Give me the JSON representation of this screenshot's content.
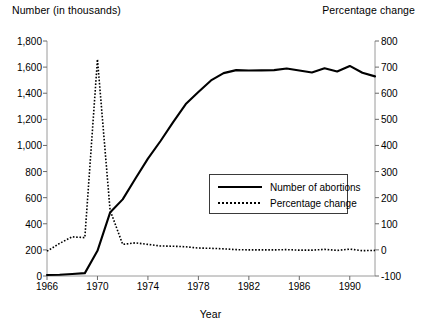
{
  "chart_data": {
    "type": "line",
    "title": "",
    "xlabel": "Year",
    "ylabel": "Number (in thousands)",
    "y2label": "Percentage change",
    "xlim": [
      1966,
      1992
    ],
    "ylim": [
      0,
      1800
    ],
    "y2lim": [
      -100,
      800
    ],
    "grid": false,
    "legend_position": "center-right",
    "x_ticks": [
      "1966",
      "1970",
      "1974",
      "1978",
      "1982",
      "1986",
      "1990"
    ],
    "x_tick_values": [
      1966,
      1970,
      1974,
      1978,
      1982,
      1986,
      1990
    ],
    "y_ticks": [
      "0",
      "200",
      "400",
      "600",
      "800",
      "1,000",
      "1,200",
      "1,400",
      "1,600",
      "1,800"
    ],
    "y_tick_values": [
      0,
      200,
      400,
      600,
      800,
      1000,
      1200,
      1400,
      1600,
      1800
    ],
    "y2_ticks": [
      "-100",
      "0",
      "100",
      "200",
      "300",
      "400",
      "500",
      "600",
      "700",
      "800"
    ],
    "y2_tick_values": [
      -100,
      0,
      100,
      200,
      300,
      400,
      500,
      600,
      700,
      800
    ],
    "x": [
      1966,
      1967,
      1968,
      1969,
      1970,
      1971,
      1972,
      1973,
      1974,
      1975,
      1976,
      1977,
      1978,
      1979,
      1980,
      1981,
      1982,
      1983,
      1984,
      1985,
      1986,
      1987,
      1988,
      1989,
      1990,
      1991,
      1992
    ],
    "series": [
      {
        "name": "Number of abortions",
        "axis": "left",
        "style": "solid",
        "color": "#000000",
        "values": [
          8,
          10,
          15,
          22,
          193,
          486,
          587,
          745,
          899,
          1034,
          1179,
          1317,
          1410,
          1498,
          1554,
          1577,
          1574,
          1575,
          1577,
          1589,
          1574,
          1559,
          1591,
          1567,
          1609,
          1557,
          1529
        ]
      },
      {
        "name": "Percentage change",
        "axis": "right",
        "style": "dotted",
        "color": "#000000",
        "values": [
          -5,
          25,
          50,
          47,
          730,
          152,
          21,
          27,
          21,
          15,
          14,
          12,
          7,
          6,
          4,
          1,
          0,
          0,
          0,
          1,
          -1,
          -1,
          2,
          -2,
          3,
          -3,
          -2
        ]
      }
    ]
  },
  "axis_titles": {
    "left": "Number (in thousands)",
    "right": "Percentage change",
    "x": "Year"
  },
  "legend": {
    "items": [
      {
        "label": "Number of abortions",
        "style": "solid"
      },
      {
        "label": "Percentage change",
        "style": "dotted"
      }
    ]
  }
}
